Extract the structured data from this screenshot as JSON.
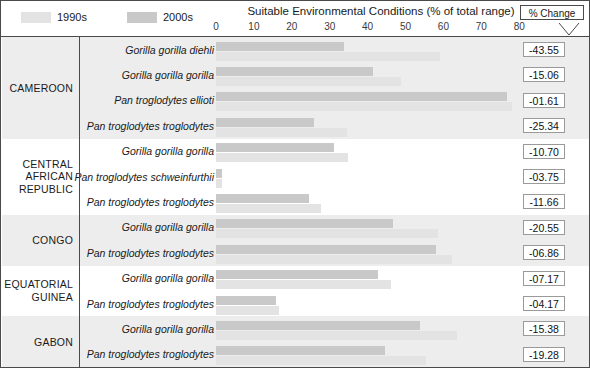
{
  "legend": {
    "items": [
      {
        "label": "1990s",
        "color": "#e3e3e3",
        "icon": "legend-swatch-1990s"
      },
      {
        "label": "2000s",
        "color": "#c9c9c9",
        "icon": "legend-swatch-2000s"
      }
    ]
  },
  "header": {
    "title": "Suitable Environmental Conditions (% of total range)",
    "pct_change_label": "% Change"
  },
  "axis": {
    "ticks": [
      "0",
      "10",
      "20",
      "30",
      "40",
      "50",
      "60",
      "70",
      "80"
    ],
    "min": 0,
    "max": 80
  },
  "countries": [
    {
      "name": "CAMEROON",
      "rows": 4
    },
    {
      "name": "CENTRAL AFRICAN REPUBLIC",
      "rows": 3
    },
    {
      "name": "CONGO",
      "rows": 2
    },
    {
      "name": "EQUATORIAL GUINEA",
      "rows": 2
    },
    {
      "name": "GABON",
      "rows": 2
    }
  ],
  "rows": [
    {
      "taxon": "Gorilla gorilla diehli",
      "country": "CAMEROON",
      "v1990": 59.2,
      "v2000": 33.7,
      "pct_change": "-43.55"
    },
    {
      "taxon": "Gorilla gorilla gorilla",
      "country": "CAMEROON",
      "v1990": 48.7,
      "v2000": 41.3,
      "pct_change": "-15.06"
    },
    {
      "taxon": "Pan troglodytes ellioti",
      "country": "CAMEROON",
      "v1990": 78.1,
      "v2000": 76.8,
      "pct_change": "-01.61"
    },
    {
      "taxon": "Pan troglodytes troglodytes",
      "country": "CAMEROON",
      "v1990": 34.6,
      "v2000": 25.8,
      "pct_change": "-25.34"
    },
    {
      "taxon": "Gorilla gorilla gorilla",
      "country": "CENTRAL AFRICAN REPUBLIC",
      "v1990": 34.9,
      "v2000": 31.1,
      "pct_change": "-10.70"
    },
    {
      "taxon": "Pan troglodytes schweinfurthii",
      "country": "CENTRAL AFRICAN REPUBLIC",
      "v1990": 1.6,
      "v2000": 1.5,
      "pct_change": "-03.75"
    },
    {
      "taxon": "Pan troglodytes troglodytes",
      "country": "CENTRAL AFRICAN REPUBLIC",
      "v1990": 27.7,
      "v2000": 24.5,
      "pct_change": "-11.66"
    },
    {
      "taxon": "Gorilla gorilla gorilla",
      "country": "CONGO",
      "v1990": 58.7,
      "v2000": 46.7,
      "pct_change": "-20.55"
    },
    {
      "taxon": "Pan troglodytes troglodytes",
      "country": "CONGO",
      "v1990": 62.4,
      "v2000": 58.1,
      "pct_change": "-06.86"
    },
    {
      "taxon": "Gorilla gorilla gorilla",
      "country": "EQUATORIAL GUINEA",
      "v1990": 46.1,
      "v2000": 42.8,
      "pct_change": "-07.17"
    },
    {
      "taxon": "Pan troglodytes troglodytes",
      "country": "EQUATORIAL GUINEA",
      "v1990": 16.6,
      "v2000": 15.9,
      "pct_change": "-04.17"
    },
    {
      "taxon": "Gorilla gorilla gorilla",
      "country": "GABON",
      "v1990": 63.6,
      "v2000": 53.8,
      "pct_change": "-15.38"
    },
    {
      "taxon": "Pan troglodytes troglodytes",
      "country": "GABON",
      "v1990": 55.4,
      "v2000": 44.7,
      "pct_change": "-19.28"
    }
  ],
  "chart_data": {
    "type": "bar",
    "title": "Suitable Environmental Conditions (% of total range)",
    "xlabel": "Suitable Environmental Conditions (% of total range)",
    "ylabel": "",
    "xlim": [
      0,
      80
    ],
    "grid": false,
    "orientation": "horizontal",
    "legend_position": "top-left",
    "categories": [
      "CAMEROON / Gorilla gorilla diehli",
      "CAMEROON / Gorilla gorilla gorilla",
      "CAMEROON / Pan troglodytes ellioti",
      "CAMEROON / Pan troglodytes troglodytes",
      "CENTRAL AFRICAN REPUBLIC / Gorilla gorilla gorilla",
      "CENTRAL AFRICAN REPUBLIC / Pan troglodytes schweinfurthii",
      "CENTRAL AFRICAN REPUBLIC / Pan troglodytes troglodytes",
      "CONGO / Gorilla gorilla gorilla",
      "CONGO / Pan troglodytes troglodytes",
      "EQUATORIAL GUINEA / Gorilla gorilla gorilla",
      "EQUATORIAL GUINEA / Pan troglodytes troglodytes",
      "GABON / Gorilla gorilla gorilla",
      "GABON / Pan troglodytes troglodytes"
    ],
    "series": [
      {
        "name": "1990s",
        "color": "#e3e3e3",
        "values": [
          59.2,
          48.7,
          78.1,
          34.6,
          34.9,
          1.6,
          27.7,
          58.7,
          62.4,
          46.1,
          16.6,
          63.6,
          55.4
        ]
      },
      {
        "name": "2000s",
        "color": "#c9c9c9",
        "values": [
          33.7,
          41.3,
          76.8,
          25.8,
          31.1,
          1.5,
          24.5,
          46.7,
          58.1,
          42.8,
          15.9,
          53.8,
          44.7
        ]
      }
    ],
    "annotations": {
      "% Change": [
        "-43.55",
        "-15.06",
        "-01.61",
        "-25.34",
        "-10.70",
        "-03.75",
        "-11.66",
        "-20.55",
        "-06.86",
        "-07.17",
        "-04.17",
        "-15.38",
        "-19.28"
      ]
    }
  }
}
